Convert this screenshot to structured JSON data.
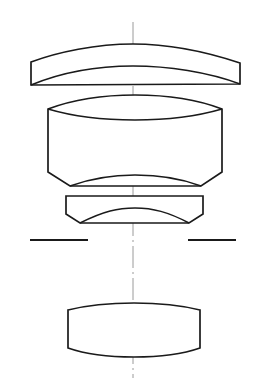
{
  "diagram": {
    "type": "optical-lens-cross-section",
    "title": "",
    "background_color": "#ffffff",
    "stroke_color": "#1a1a1a",
    "axis_color": "#9a9a9a",
    "canvas": {
      "width": 254,
      "height": 391
    },
    "optical_axis": {
      "name": "optical-axis",
      "orientation": "vertical",
      "x": 133,
      "y_start": 22,
      "y_end": 378,
      "style": "dash-dot",
      "color": "#9a9a9a"
    },
    "elements": [
      {
        "index": 1,
        "name": "lens-element-1",
        "lens_type": "meniscus",
        "label": "",
        "bounds": {
          "x_left": 31,
          "x_right": 240,
          "y_top": 44,
          "y_bottom": 86
        },
        "left_edge_thickness": 23,
        "right_edge_thickness": 21,
        "path": "M 31 62 L 31 85 L 240 84 L 240 63 C 195 48 160 44 133 44 C 96 44 58 52 31 62 Z",
        "inner_surface_path": "M 31 85 C 60 73 96 66 133 66 C 168 66 208 72 240 84"
      },
      {
        "index": 2,
        "name": "lens-element-2",
        "lens_type": "cemented-doublet",
        "label": "",
        "bounds": {
          "x_left": 48,
          "x_right": 222,
          "y_top": 95,
          "y_bottom": 189
        },
        "path": "M 48 109 L 48 172 L 70 186 L 201 186 L 222 172 L 222 109 C 196 99 165 95 135 95 C 103 95 72 100 48 109 Z",
        "cement_surface_path": "M 48 109 C 75 117 104 120 135 120 C 167 120 198 116 222 109",
        "bottom_surface_path": "M 70 186 C 92 178 113 175 135 175 C 158 175 180 178 201 186"
      },
      {
        "index": 3,
        "name": "lens-element-3",
        "lens_type": "plano-concave",
        "label": "",
        "bounds": {
          "x_left": 66,
          "x_right": 203,
          "y_top": 195,
          "y_bottom": 223
        },
        "path": "M 66 196 L 66 214 L 80 223 L 189 223 L 203 214 L 203 196 Z",
        "concave_surface_path": "M 80 223 C 104 211 118 208 135 208 C 153 208 168 212 189 223",
        "top_surface_path": "M 66 196 L 203 196"
      },
      {
        "index": 4,
        "name": "aperture-stop",
        "lens_type": "stop",
        "label": "",
        "segments": [
          {
            "name": "aperture-stop-left",
            "x1": 30,
            "x2": 88,
            "y": 240
          },
          {
            "name": "aperture-stop-right",
            "x1": 188,
            "x2": 236,
            "y": 240
          }
        ]
      },
      {
        "index": 5,
        "name": "lens-element-4",
        "lens_type": "biconvex",
        "label": "",
        "bounds": {
          "x_left": 68,
          "x_right": 200,
          "y_top": 305,
          "y_bottom": 356
        },
        "path": "M 68 310 L 68 348 C 88 355 110 357 134 357 C 158 357 180 355 200 348 L 200 310 C 180 305 158 303 134 303 C 110 303 88 305 68 310 Z"
      }
    ]
  }
}
